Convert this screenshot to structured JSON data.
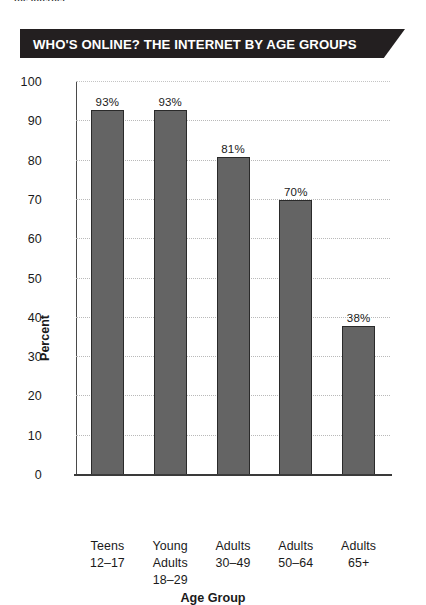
{
  "page": {
    "clipped_running_text": "the internet",
    "background_color": "#ffffff"
  },
  "banner": {
    "title": "WHO'S ONLINE? THE INTERNET BY AGE GROUPS",
    "background_color": "#231f20",
    "text_color": "#ffffff"
  },
  "chart_data": {
    "type": "bar",
    "title": "WHO'S ONLINE? THE INTERNET BY AGE GROUPS",
    "categories": [
      "Teens 12–17",
      "Young Adults 18–29",
      "Adults 30–49",
      "Adults 50–64",
      "Adults 65+"
    ],
    "category_lines": [
      [
        "Teens",
        "12–17"
      ],
      [
        "Young",
        "Adults",
        "18–29"
      ],
      [
        "Adults",
        "30–49"
      ],
      [
        "Adults",
        "50–64"
      ],
      [
        "Adults",
        "65+"
      ]
    ],
    "values": [
      93,
      93,
      81,
      70,
      38
    ],
    "value_labels": [
      "93%",
      "93%",
      "81%",
      "70%",
      "38%"
    ],
    "xlabel": "Age Group",
    "ylabel": "Percent",
    "ylim": [
      0,
      100
    ],
    "yticks": [
      0,
      10,
      20,
      30,
      40,
      50,
      60,
      70,
      80,
      90,
      100
    ],
    "ytick_labels": [
      "0",
      "10",
      "20",
      "30",
      "40",
      "50",
      "60",
      "70",
      "80",
      "90",
      "100"
    ],
    "grid": true,
    "grid_axis": "y",
    "legend": null,
    "bar_color": "#646464",
    "bar_edge_color": "#2a2a2a",
    "gridline_color": "#b9b9b9",
    "axis_color": "#3a3a3a"
  }
}
